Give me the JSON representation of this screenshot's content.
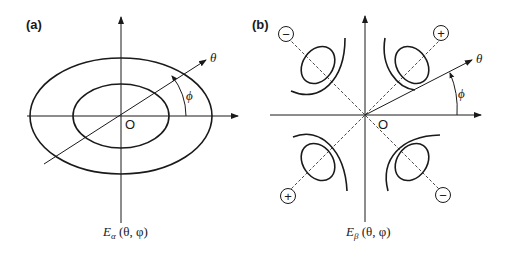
{
  "panels": [
    {
      "id": "a",
      "label": "(a)",
      "origin_label": "O",
      "direction_label": "θ",
      "angle_label": "ϕ",
      "caption_main": "E",
      "caption_sub": "α",
      "caption_args": " (θ, φ)"
    },
    {
      "id": "b",
      "label": "(b)",
      "origin_label": "O",
      "direction_label": "θ",
      "angle_label": "ϕ",
      "caption_main": "E",
      "caption_sub": "β",
      "caption_args": " (θ, φ)",
      "signs": {
        "top_left": "−",
        "top_right": "+",
        "bottom_left": "+",
        "bottom_right": "−"
      }
    }
  ],
  "colors": {
    "stroke": "#1a1a1a",
    "background": "#ffffff"
  }
}
